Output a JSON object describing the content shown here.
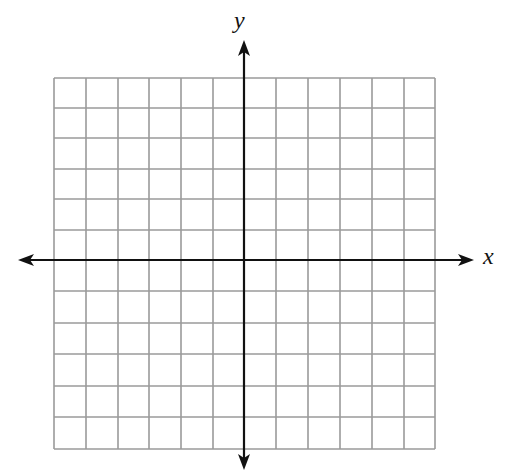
{
  "diagram": {
    "type": "coordinate-grid",
    "axes": {
      "x_label": "x",
      "y_label": "y",
      "color": "#111111",
      "stroke_width": 2.2
    },
    "grid": {
      "columns": 12,
      "rows": 12,
      "color": "#9a9a9a",
      "stroke_width": 1.6,
      "bounds": {
        "left": 54,
        "top": 78,
        "right": 435,
        "bottom": 449
      },
      "x_lines": [
        54,
        86,
        118,
        149,
        181,
        213,
        244,
        276,
        308,
        340,
        372,
        404,
        435
      ],
      "y_lines": [
        78,
        108,
        138,
        169,
        199,
        230,
        260,
        291,
        323,
        354,
        386,
        417,
        449
      ]
    },
    "origin": {
      "x": 244,
      "y": 260
    },
    "arrows": {
      "left_tip": 18,
      "right_tip": 474,
      "top_tip": 40,
      "bottom_tip": 470
    }
  }
}
